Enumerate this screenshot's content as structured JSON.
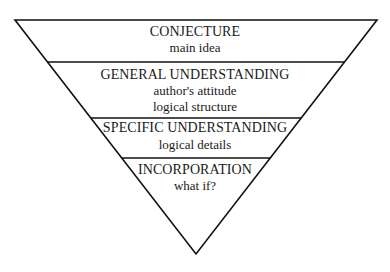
{
  "diagram": {
    "type": "inverted-pyramid",
    "levels": [
      {
        "title": "CONJECTURE",
        "lines": [
          "main idea"
        ]
      },
      {
        "title": "GENERAL UNDERSTANDING",
        "lines": [
          "author's attitude",
          "logical structure"
        ]
      },
      {
        "title": "SPECIFIC UNDERSTANDING",
        "lines": [
          "logical details"
        ]
      },
      {
        "title": "INCORPORATION",
        "lines": [
          "what if?"
        ]
      }
    ]
  }
}
